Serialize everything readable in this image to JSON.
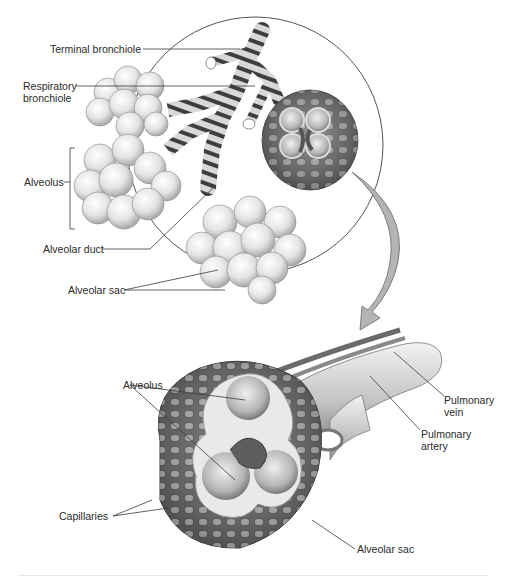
{
  "diagram": {
    "top_view": {
      "labels": [
        {
          "id": "terminal-bronchiole",
          "text": "Terminal bronchiole"
        },
        {
          "id": "respiratory-bronchiole",
          "text": "Respiratory\nbronchiole",
          "line1": "Respiratory",
          "line2": "bronchiole"
        },
        {
          "id": "alveolus",
          "text": "Alveolus"
        },
        {
          "id": "alveolar-duct",
          "text": "Alveolar duct"
        },
        {
          "id": "alveolar-sac",
          "text": "Alveolar sac"
        }
      ]
    },
    "bottom_view": {
      "labels": [
        {
          "id": "alveolus",
          "text": "Alveolus"
        },
        {
          "id": "capillaries",
          "text": "Capillaries"
        },
        {
          "id": "pulmonary-vein",
          "text": "Pulmonary\nvein",
          "line1": "Pulmonary",
          "line2": "vein"
        },
        {
          "id": "pulmonary-artery",
          "text": "Pulmonary\nartery",
          "line1": "Pulmonary",
          "line2": "artery"
        },
        {
          "id": "alveolar-sac",
          "text": "Alveolar sac"
        }
      ]
    },
    "colors": {
      "leader_line": "#3a3a3a",
      "circle_outline": "#555555",
      "arrow_fill": "#b4b4b4",
      "tissue_light": "#e8e8e8",
      "tissue_mid": "#9a9a9a",
      "tissue_dark": "#4a4a4a"
    }
  }
}
